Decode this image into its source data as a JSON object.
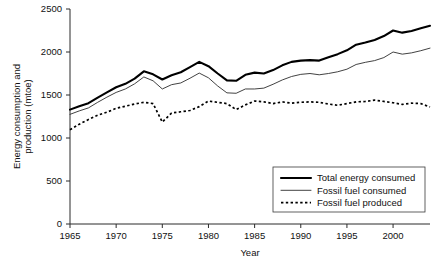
{
  "chart_data": {
    "type": "line",
    "title": "",
    "xlabel": "Year",
    "ylabel": "Energy consumption and production (mtoe)",
    "ylabel_line1": "Energy consumption and",
    "ylabel_line2": "production (mtoe)",
    "xlim": [
      1965,
      2004
    ],
    "ylim": [
      0,
      2500
    ],
    "ytick_labels": [
      "0",
      "500",
      "1000",
      "1500",
      "2000",
      "2500"
    ],
    "yticks": [
      0,
      500,
      1000,
      1500,
      2000,
      2500
    ],
    "xtick_labels": [
      "1965",
      "1970",
      "1975",
      "1980",
      "1985",
      "1990",
      "1995",
      "2000"
    ],
    "xticks": [
      1965,
      1970,
      1975,
      1980,
      1985,
      1990,
      1995,
      2000
    ],
    "grid": false,
    "legend_position": "lower right",
    "x": [
      1965,
      1966,
      1967,
      1968,
      1969,
      1970,
      1971,
      1972,
      1973,
      1974,
      1975,
      1976,
      1977,
      1978,
      1979,
      1980,
      1981,
      1982,
      1983,
      1984,
      1985,
      1986,
      1987,
      1988,
      1989,
      1990,
      1991,
      1992,
      1993,
      1994,
      1995,
      1996,
      1997,
      1998,
      1999,
      2000,
      2001,
      2002,
      2003,
      2004
    ],
    "series": [
      {
        "name": "Total energy consumed",
        "style": "thick-solid",
        "color": "#000000",
        "values": [
          1330,
          1370,
          1405,
          1470,
          1530,
          1590,
          1630,
          1690,
          1775,
          1740,
          1680,
          1730,
          1765,
          1825,
          1885,
          1835,
          1750,
          1670,
          1665,
          1735,
          1760,
          1750,
          1790,
          1845,
          1885,
          1900,
          1905,
          1900,
          1940,
          1975,
          2020,
          2085,
          2110,
          2140,
          2185,
          2250,
          2225,
          2245,
          2275,
          2305
        ]
      },
      {
        "name": "Fossil fuel consumed",
        "style": "thin-solid",
        "color": "#2c2c2c",
        "values": [
          1275,
          1315,
          1350,
          1415,
          1475,
          1530,
          1570,
          1630,
          1710,
          1665,
          1570,
          1620,
          1640,
          1695,
          1755,
          1700,
          1605,
          1525,
          1520,
          1570,
          1570,
          1580,
          1625,
          1675,
          1715,
          1740,
          1750,
          1735,
          1750,
          1770,
          1800,
          1855,
          1880,
          1900,
          1935,
          2000,
          1975,
          1990,
          2015,
          2045
        ]
      },
      {
        "name": "Fossil fuel produced",
        "style": "dotted",
        "color": "#000000",
        "values": [
          1095,
          1160,
          1215,
          1265,
          1300,
          1345,
          1370,
          1395,
          1415,
          1400,
          1185,
          1290,
          1305,
          1320,
          1365,
          1430,
          1415,
          1400,
          1330,
          1385,
          1430,
          1420,
          1400,
          1420,
          1405,
          1415,
          1420,
          1415,
          1395,
          1380,
          1400,
          1420,
          1425,
          1440,
          1425,
          1410,
          1390,
          1405,
          1400,
          1360
        ]
      }
    ],
    "legend": [
      {
        "label": "Total energy consumed",
        "style": "thick-solid"
      },
      {
        "label": "Fossil fuel consumed",
        "style": "thin-solid"
      },
      {
        "label": "Fossil fuel produced",
        "style": "dotted"
      }
    ]
  },
  "caption": ""
}
